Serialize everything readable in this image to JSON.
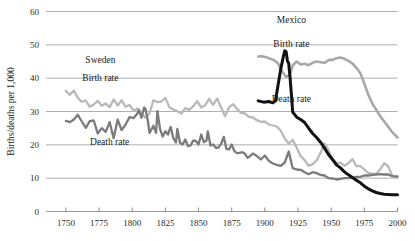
{
  "chart_data": {
    "type": "line",
    "title": "",
    "xlabel": "",
    "ylabel": "Births/deaths per 1,000",
    "xlim": [
      1735,
      2000
    ],
    "ylim": [
      0,
      60
    ],
    "grid": true,
    "legend_position": "inline-annotations",
    "x_ticks": [
      1750,
      1775,
      1800,
      1825,
      1850,
      1875,
      1900,
      1925,
      1950,
      1975,
      2000
    ],
    "x_tick_labels": [
      "1750",
      "1775",
      "1800",
      "1825",
      "1850",
      "1875",
      "1900",
      "1925",
      "1950",
      "1975",
      "2000"
    ],
    "y_ticks": [
      0,
      10,
      20,
      30,
      40,
      50,
      60
    ],
    "y_tick_labels": [
      "0",
      "10",
      "20",
      "30",
      "40",
      "50",
      "60"
    ],
    "annotations": [
      {
        "id": "sweden-group",
        "text": "Sweden",
        "x": 1776,
        "y": 44.5
      },
      {
        "id": "sweden-birth",
        "text": "Birth rate",
        "x": 1776,
        "y": 39.2
      },
      {
        "id": "sweden-death",
        "text": "Death rate",
        "x": 1783,
        "y": 20.0
      },
      {
        "id": "mexico-group",
        "text": "Mexico",
        "x": 1920,
        "y": 56.5
      },
      {
        "id": "mexico-birth",
        "text": "Birth rate",
        "x": 1920,
        "y": 49.5
      },
      {
        "id": "mexico-death",
        "text": "Death rate",
        "x": 1920,
        "y": 33.0
      }
    ],
    "series": [
      {
        "name": "Sweden Birth rate",
        "country": "Sweden",
        "measure": "birth",
        "color": "#b9b9b9",
        "width": 2.3,
        "points": [
          [
            1750,
            36.2
          ],
          [
            1753,
            35.0
          ],
          [
            1756,
            36.3
          ],
          [
            1759,
            34.1
          ],
          [
            1762,
            32.9
          ],
          [
            1765,
            33.3
          ],
          [
            1768,
            31.4
          ],
          [
            1771,
            32.1
          ],
          [
            1774,
            33.2
          ],
          [
            1777,
            31.7
          ],
          [
            1780,
            32.4
          ],
          [
            1783,
            31.3
          ],
          [
            1786,
            33.6
          ],
          [
            1789,
            31.8
          ],
          [
            1792,
            33.4
          ],
          [
            1795,
            31.4
          ],
          [
            1798,
            32.0
          ],
          [
            1801,
            30.2
          ],
          [
            1804,
            30.9
          ],
          [
            1807,
            29.5
          ],
          [
            1810,
            28.1
          ],
          [
            1813,
            29.4
          ],
          [
            1816,
            33.4
          ],
          [
            1819,
            32.8
          ],
          [
            1822,
            33.0
          ],
          [
            1825,
            34.1
          ],
          [
            1828,
            31.3
          ],
          [
            1831,
            30.6
          ],
          [
            1834,
            30.1
          ],
          [
            1837,
            29.4
          ],
          [
            1840,
            31.0
          ],
          [
            1843,
            30.5
          ],
          [
            1846,
            31.6
          ],
          [
            1849,
            33.1
          ],
          [
            1852,
            31.2
          ],
          [
            1855,
            31.9
          ],
          [
            1858,
            33.8
          ],
          [
            1861,
            32.0
          ],
          [
            1864,
            33.9
          ],
          [
            1867,
            31.2
          ],
          [
            1870,
            28.6
          ],
          [
            1873,
            31.3
          ],
          [
            1876,
            32.2
          ],
          [
            1879,
            30.8
          ],
          [
            1882,
            29.6
          ],
          [
            1885,
            29.4
          ],
          [
            1888,
            28.4
          ],
          [
            1891,
            28.2
          ],
          [
            1894,
            27.4
          ],
          [
            1897,
            26.9
          ],
          [
            1900,
            27.0
          ],
          [
            1903,
            26.1
          ],
          [
            1906,
            25.8
          ],
          [
            1909,
            25.5
          ],
          [
            1912,
            24.2
          ],
          [
            1915,
            21.9
          ],
          [
            1918,
            20.4
          ],
          [
            1921,
            21.5
          ],
          [
            1924,
            19.1
          ],
          [
            1927,
            16.6
          ],
          [
            1930,
            15.4
          ],
          [
            1933,
            13.7
          ],
          [
            1936,
            14.2
          ],
          [
            1939,
            15.3
          ],
          [
            1942,
            17.6
          ],
          [
            1945,
            20.4
          ],
          [
            1948,
            18.4
          ],
          [
            1951,
            15.6
          ],
          [
            1954,
            14.6
          ],
          [
            1957,
            14.6
          ],
          [
            1960,
            13.7
          ],
          [
            1963,
            14.5
          ],
          [
            1966,
            15.7
          ],
          [
            1969,
            13.6
          ],
          [
            1972,
            13.6
          ],
          [
            1975,
            12.6
          ],
          [
            1978,
            11.6
          ],
          [
            1981,
            11.3
          ],
          [
            1984,
            11.3
          ],
          [
            1987,
            12.6
          ],
          [
            1990,
            14.5
          ],
          [
            1993,
            13.5
          ],
          [
            1996,
            10.8
          ],
          [
            2000,
            10.2
          ]
        ]
      },
      {
        "name": "Sweden Death rate",
        "country": "Sweden",
        "measure": "death",
        "color": "#7b7b7b",
        "width": 2.3,
        "points": [
          [
            1750,
            27.2
          ],
          [
            1753,
            26.8
          ],
          [
            1756,
            27.6
          ],
          [
            1759,
            29.0
          ],
          [
            1762,
            27.0
          ],
          [
            1765,
            25.1
          ],
          [
            1768,
            27.1
          ],
          [
            1771,
            27.3
          ],
          [
            1774,
            23.4
          ],
          [
            1777,
            25.0
          ],
          [
            1780,
            23.9
          ],
          [
            1783,
            26.8
          ],
          [
            1786,
            22.0
          ],
          [
            1789,
            27.6
          ],
          [
            1792,
            24.4
          ],
          [
            1795,
            26.1
          ],
          [
            1798,
            28.3
          ],
          [
            1801,
            28.0
          ],
          [
            1804,
            29.5
          ],
          [
            1805,
            30.4
          ],
          [
            1807,
            28.1
          ],
          [
            1809,
            31.2
          ],
          [
            1810,
            30.8
          ],
          [
            1812,
            26.7
          ],
          [
            1813,
            23.6
          ],
          [
            1816,
            25.7
          ],
          [
            1818,
            23.6
          ],
          [
            1819,
            30.1
          ],
          [
            1821,
            24.7
          ],
          [
            1823,
            22.5
          ],
          [
            1825,
            24.1
          ],
          [
            1827,
            23.1
          ],
          [
            1829,
            25.4
          ],
          [
            1831,
            22.0
          ],
          [
            1833,
            20.7
          ],
          [
            1834,
            24.8
          ],
          [
            1836,
            20.6
          ],
          [
            1838,
            20.1
          ],
          [
            1840,
            21.6
          ],
          [
            1842,
            19.6
          ],
          [
            1844,
            19.8
          ],
          [
            1846,
            21.3
          ],
          [
            1848,
            21.2
          ],
          [
            1850,
            20.1
          ],
          [
            1852,
            23.1
          ],
          [
            1854,
            20.8
          ],
          [
            1856,
            21.3
          ],
          [
            1857,
            24.0
          ],
          [
            1859,
            19.8
          ],
          [
            1861,
            20.1
          ],
          [
            1863,
            19.1
          ],
          [
            1865,
            19.2
          ],
          [
            1867,
            20.3
          ],
          [
            1869,
            22.4
          ],
          [
            1871,
            18.8
          ],
          [
            1873,
            18.6
          ],
          [
            1875,
            20.1
          ],
          [
            1877,
            18.1
          ],
          [
            1879,
            17.5
          ],
          [
            1881,
            17.6
          ],
          [
            1883,
            17.8
          ],
          [
            1885,
            17.3
          ],
          [
            1887,
            16.1
          ],
          [
            1889,
            16.7
          ],
          [
            1891,
            17.4
          ],
          [
            1893,
            16.9
          ],
          [
            1895,
            16.3
          ],
          [
            1897,
            15.6
          ],
          [
            1900,
            16.8
          ],
          [
            1903,
            15.2
          ],
          [
            1906,
            14.4
          ],
          [
            1909,
            14.0
          ],
          [
            1912,
            13.7
          ],
          [
            1915,
            14.7
          ],
          [
            1918,
            18.0
          ],
          [
            1921,
            13.0
          ],
          [
            1924,
            12.6
          ],
          [
            1927,
            12.5
          ],
          [
            1930,
            11.8
          ],
          [
            1933,
            11.2
          ],
          [
            1936,
            11.8
          ],
          [
            1939,
            11.5
          ],
          [
            1942,
            11.0
          ],
          [
            1945,
            10.8
          ],
          [
            1948,
            10.0
          ],
          [
            1951,
            9.9
          ],
          [
            1954,
            9.6
          ],
          [
            1957,
            9.8
          ],
          [
            1960,
            10.0
          ],
          [
            1963,
            10.0
          ],
          [
            1966,
            10.1
          ],
          [
            1969,
            10.4
          ],
          [
            1972,
            10.4
          ],
          [
            1975,
            10.8
          ],
          [
            1978,
            10.8
          ],
          [
            1981,
            11.0
          ],
          [
            1984,
            11.1
          ],
          [
            1987,
            11.2
          ],
          [
            1990,
            11.1
          ],
          [
            1993,
            11.1
          ],
          [
            1996,
            10.6
          ],
          [
            2000,
            10.5
          ]
        ]
      },
      {
        "name": "Mexico Birth rate",
        "country": "Mexico",
        "measure": "birth",
        "color": "#a8a8a8",
        "width": 2.6,
        "points": [
          [
            1895,
            46.5
          ],
          [
            1898,
            46.6
          ],
          [
            1901,
            46.3
          ],
          [
            1904,
            45.8
          ],
          [
            1907,
            45.4
          ],
          [
            1910,
            44.4
          ],
          [
            1913,
            42.0
          ],
          [
            1916,
            40.4
          ],
          [
            1919,
            41.1
          ],
          [
            1921,
            43.9
          ],
          [
            1924,
            45.0
          ],
          [
            1927,
            44.1
          ],
          [
            1930,
            44.3
          ],
          [
            1933,
            43.9
          ],
          [
            1936,
            44.6
          ],
          [
            1939,
            45.0
          ],
          [
            1942,
            44.8
          ],
          [
            1945,
            44.6
          ],
          [
            1948,
            45.4
          ],
          [
            1951,
            45.5
          ],
          [
            1954,
            46.0
          ],
          [
            1957,
            46.2
          ],
          [
            1960,
            45.8
          ],
          [
            1963,
            45.2
          ],
          [
            1966,
            44.4
          ],
          [
            1969,
            43.1
          ],
          [
            1972,
            41.5
          ],
          [
            1975,
            38.4
          ],
          [
            1978,
            35.0
          ],
          [
            1981,
            32.4
          ],
          [
            1984,
            30.5
          ],
          [
            1987,
            28.6
          ],
          [
            1990,
            27.0
          ],
          [
            1993,
            25.4
          ],
          [
            1996,
            23.8
          ],
          [
            2000,
            22.2
          ]
        ]
      },
      {
        "name": "Mexico Death rate",
        "country": "Mexico",
        "measure": "death",
        "color": "#121212",
        "width": 3.0,
        "points": [
          [
            1895,
            33.2
          ],
          [
            1899,
            32.8
          ],
          [
            1903,
            33.0
          ],
          [
            1906,
            32.6
          ],
          [
            1908,
            33.2
          ],
          [
            1910,
            38.0
          ],
          [
            1912,
            42.8
          ],
          [
            1914,
            46.6
          ],
          [
            1915,
            48.2
          ],
          [
            1916,
            48.0
          ],
          [
            1917,
            45.2
          ],
          [
            1918,
            44.4
          ],
          [
            1919,
            40.2
          ],
          [
            1920,
            35.1
          ],
          [
            1921,
            29.8
          ],
          [
            1924,
            28.3
          ],
          [
            1927,
            27.6
          ],
          [
            1930,
            26.7
          ],
          [
            1933,
            25.0
          ],
          [
            1936,
            23.4
          ],
          [
            1939,
            22.2
          ],
          [
            1942,
            20.8
          ],
          [
            1945,
            19.0
          ],
          [
            1948,
            17.1
          ],
          [
            1951,
            15.6
          ],
          [
            1954,
            14.0
          ],
          [
            1957,
            13.1
          ],
          [
            1960,
            11.9
          ],
          [
            1963,
            11.0
          ],
          [
            1966,
            10.2
          ],
          [
            1969,
            9.4
          ],
          [
            1972,
            8.6
          ],
          [
            1975,
            7.6
          ],
          [
            1978,
            6.8
          ],
          [
            1981,
            6.2
          ],
          [
            1984,
            5.7
          ],
          [
            1987,
            5.4
          ],
          [
            1990,
            5.2
          ],
          [
            1993,
            5.1
          ],
          [
            1996,
            5.0
          ],
          [
            2000,
            5.0
          ]
        ]
      }
    ]
  }
}
